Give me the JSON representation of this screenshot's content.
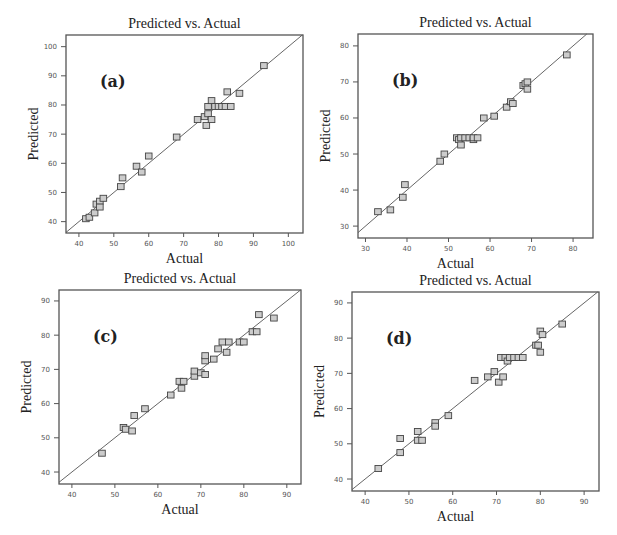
{
  "chart_data": [
    {
      "type": "scatter",
      "panel_label": "(a)",
      "title": "Predicted vs. Actual",
      "xlabel": "Actual",
      "ylabel": "Predicted",
      "xticks": [
        40,
        50,
        60,
        70,
        80,
        90,
        100
      ],
      "yticks": [
        40,
        50,
        60,
        70,
        80,
        90,
        100
      ],
      "xlim": [
        36.3,
        104.2
      ],
      "ylim": [
        36.1,
        104.0
      ],
      "grid": false,
      "reference_line": "y = x",
      "points": [
        [
          42,
          41
        ],
        [
          43,
          41.5
        ],
        [
          44.5,
          43
        ],
        [
          45,
          46
        ],
        [
          46,
          47
        ],
        [
          46,
          45
        ],
        [
          47,
          48
        ],
        [
          52,
          52
        ],
        [
          52.5,
          55
        ],
        [
          56.5,
          59
        ],
        [
          58,
          57
        ],
        [
          60,
          62.5
        ],
        [
          68,
          69
        ],
        [
          74,
          75
        ],
        [
          76,
          76
        ],
        [
          76.5,
          73
        ],
        [
          77,
          77
        ],
        [
          77,
          79.5
        ],
        [
          78,
          81.5
        ],
        [
          78,
          75
        ],
        [
          79,
          79.5
        ],
        [
          80,
          79.5
        ],
        [
          81,
          79.5
        ],
        [
          82,
          79.5
        ],
        [
          82.5,
          84.5
        ],
        [
          83.5,
          79.5
        ],
        [
          86,
          84
        ],
        [
          93,
          93.5
        ]
      ]
    },
    {
      "type": "scatter",
      "panel_label": "(b)",
      "title": "Predicted vs. Actual",
      "xlabel": "Actual",
      "ylabel": "Predicted",
      "xticks": [
        30,
        40,
        50,
        60,
        70,
        80
      ],
      "yticks": [
        30,
        40,
        50,
        60,
        70,
        80
      ],
      "xlim": [
        28.2,
        84.8
      ],
      "ylim": [
        26.7,
        83.3
      ],
      "grid": false,
      "reference_line": "y = x",
      "points": [
        [
          33,
          34
        ],
        [
          36,
          34.5
        ],
        [
          39,
          38
        ],
        [
          39.5,
          41.5
        ],
        [
          48,
          48
        ],
        [
          49,
          50
        ],
        [
          52,
          54.5
        ],
        [
          52.5,
          54
        ],
        [
          53,
          52.5
        ],
        [
          53,
          54.5
        ],
        [
          54,
          54.5
        ],
        [
          55,
          54.5
        ],
        [
          56,
          54
        ],
        [
          56,
          54.5
        ],
        [
          57,
          54.5
        ],
        [
          58.5,
          60
        ],
        [
          61,
          60.5
        ],
        [
          64,
          63
        ],
        [
          65,
          64.5
        ],
        [
          65.5,
          64
        ],
        [
          68,
          69
        ],
        [
          68.5,
          69.5
        ],
        [
          69,
          70
        ],
        [
          69,
          68
        ],
        [
          78.5,
          77.5
        ]
      ]
    },
    {
      "type": "scatter",
      "panel_label": "(c)",
      "title": "Predicted vs. Actual",
      "xlabel": "Actual",
      "ylabel": "Predicted",
      "xticks": [
        40,
        50,
        60,
        70,
        80,
        90
      ],
      "yticks": [
        40,
        50,
        60,
        70,
        80,
        90
      ],
      "xlim": [
        37.0,
        93.3
      ],
      "ylim": [
        36.5,
        93.2
      ],
      "grid": false,
      "reference_line": "y = x",
      "points": [
        [
          47,
          45.5
        ],
        [
          52,
          53
        ],
        [
          52.5,
          52.5
        ],
        [
          54,
          52
        ],
        [
          54.5,
          56.5
        ],
        [
          57,
          58.5
        ],
        [
          63,
          62.5
        ],
        [
          65,
          66.5
        ],
        [
          65.5,
          64.5
        ],
        [
          66,
          66.5
        ],
        [
          68.5,
          68
        ],
        [
          68.5,
          69.5
        ],
        [
          70,
          69
        ],
        [
          71,
          68.5
        ],
        [
          71,
          72.5
        ],
        [
          71,
          74
        ],
        [
          73,
          73
        ],
        [
          74,
          76
        ],
        [
          75,
          78
        ],
        [
          76,
          75
        ],
        [
          76.5,
          78
        ],
        [
          79,
          78
        ],
        [
          80,
          78
        ],
        [
          82,
          81
        ],
        [
          83,
          81
        ],
        [
          83.5,
          86
        ],
        [
          87,
          85
        ]
      ]
    },
    {
      "type": "scatter",
      "panel_label": "(d)",
      "title": "Predicted vs. Actual",
      "xlabel": "Actual",
      "ylabel": "Predicted",
      "xticks": [
        40,
        50,
        60,
        70,
        80,
        90
      ],
      "yticks": [
        40,
        50,
        60,
        70,
        80,
        90
      ],
      "xlim": [
        37.0,
        93.4
      ],
      "ylim": [
        36.6,
        93.1
      ],
      "grid": false,
      "reference_line": "y = x",
      "points": [
        [
          43,
          43
        ],
        [
          48,
          51.5
        ],
        [
          48,
          47.5
        ],
        [
          52,
          53.5
        ],
        [
          52,
          51
        ],
        [
          53,
          51
        ],
        [
          56,
          56
        ],
        [
          56,
          55
        ],
        [
          59,
          58
        ],
        [
          65,
          68
        ],
        [
          68,
          69
        ],
        [
          69.5,
          70.5
        ],
        [
          70.5,
          67.5
        ],
        [
          71,
          74.5
        ],
        [
          71.5,
          69
        ],
        [
          72,
          74.5
        ],
        [
          72.5,
          73.5
        ],
        [
          73,
          74.5
        ],
        [
          74,
          74.5
        ],
        [
          75,
          74.5
        ],
        [
          76,
          74.5
        ],
        [
          79,
          78
        ],
        [
          79.5,
          78
        ],
        [
          80,
          82
        ],
        [
          80,
          76
        ],
        [
          80.5,
          81
        ],
        [
          85,
          84
        ]
      ]
    }
  ],
  "layout": {
    "panels": [
      {
        "left": 66,
        "top": 35,
        "width": 237,
        "height": 198
      },
      {
        "left": 358,
        "top": 34,
        "width": 235,
        "height": 204
      },
      {
        "left": 59,
        "top": 290,
        "width": 242,
        "height": 194
      },
      {
        "left": 352,
        "top": 292,
        "width": 247,
        "height": 199
      }
    ]
  }
}
